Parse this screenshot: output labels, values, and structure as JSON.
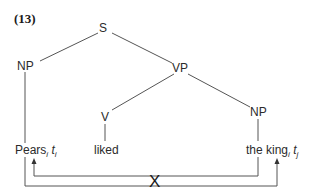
{
  "example_number": "(13)",
  "tree": {
    "root": "S",
    "subject_np": "NP",
    "vp": "VP",
    "verb_node": "V",
    "object_np": "NP"
  },
  "leaves": {
    "subject": {
      "word": "Pears",
      "index": "i",
      "trace": "t",
      "trace_index": "i"
    },
    "verb": {
      "word": "liked"
    },
    "object": {
      "word": "the king",
      "index": "i",
      "trace": "t",
      "trace_index": "j"
    }
  },
  "crossing_mark": "X",
  "colors": {
    "line": "#555555",
    "text": "#2b2b2b",
    "background": "#ffffff"
  }
}
